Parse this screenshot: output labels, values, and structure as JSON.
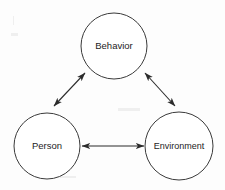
{
  "diagram": {
    "background_color": "#fdfdfd",
    "stroke_color": "#3a3a3a",
    "text_color": "#1d1d1d",
    "nodes": [
      {
        "id": "behavior",
        "label": "Behavior",
        "shape": "circle",
        "cx": 114,
        "cy": 46,
        "r": 33
      },
      {
        "id": "person",
        "label": "Person",
        "shape": "circle",
        "cx": 47,
        "cy": 146,
        "r": 33
      },
      {
        "id": "environment",
        "label": "Environment",
        "shape": "circle",
        "cx": 179,
        "cy": 146,
        "r": 34
      }
    ],
    "edges": [
      {
        "id": "person-behavior",
        "from": "person",
        "to": "behavior",
        "direction": "bidirectional",
        "x1": 54,
        "y1": 106,
        "x2": 85,
        "y2": 73
      },
      {
        "id": "behavior-environment",
        "from": "behavior",
        "to": "environment",
        "direction": "bidirectional",
        "x1": 145,
        "y1": 73,
        "x2": 175,
        "y2": 106
      },
      {
        "id": "person-environment",
        "from": "person",
        "to": "environment",
        "direction": "bidirectional",
        "x1": 82,
        "y1": 146,
        "x2": 144,
        "y2": 146
      }
    ]
  }
}
